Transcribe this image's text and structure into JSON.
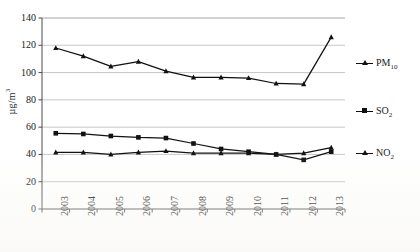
{
  "chart_data": {
    "type": "line",
    "title": "",
    "xlabel": "",
    "ylabel": "µg/m³",
    "categories": [
      "2003",
      "2004",
      "2005",
      "2006",
      "2007",
      "2008",
      "2009",
      "2010",
      "2011",
      "2012",
      "2013"
    ],
    "ylim": [
      0,
      140
    ],
    "y_ticks": [
      0,
      20,
      40,
      60,
      80,
      100,
      120,
      140
    ],
    "grid": true,
    "legend_position": "right",
    "series": [
      {
        "name": "PM10",
        "label_base": "PM",
        "label_sub": "10",
        "marker": "triangle",
        "color": "#111111",
        "values": [
          118,
          112,
          104.5,
          108,
          101,
          96.5,
          96.5,
          96,
          92,
          91.5,
          126
        ]
      },
      {
        "name": "SO2",
        "label_base": "SO",
        "label_sub": "2",
        "marker": "square",
        "color": "#111111",
        "values": [
          55.5,
          55,
          53.5,
          52.5,
          52,
          48,
          44,
          42,
          40,
          36,
          42
        ]
      },
      {
        "name": "NO2",
        "label_base": "NO",
        "label_sub": "2",
        "marker": "triangle",
        "color": "#111111",
        "values": [
          41.5,
          41.5,
          40,
          41.5,
          42.5,
          41,
          41,
          41,
          40,
          41,
          45
        ]
      }
    ]
  },
  "axis": {
    "y_tick_labels": [
      "0",
      "20",
      "40",
      "60",
      "80",
      "100",
      "120",
      "140"
    ],
    "x_tick_labels": [
      "2003",
      "2004",
      "2005",
      "2006",
      "2007",
      "2008",
      "2009",
      "2010",
      "2011",
      "2012",
      "2013"
    ],
    "y_title_main": "µg/m",
    "y_title_sup": "3"
  }
}
